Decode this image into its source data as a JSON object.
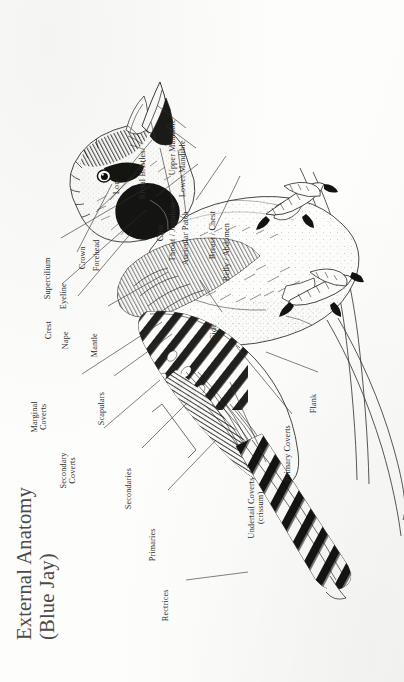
{
  "title": {
    "line1": "External Anatomy",
    "line2": "(Blue Jay)"
  },
  "subject": "Blue Jay",
  "diagram_type": "labeled anatomical illustration",
  "orientation": "bird rotated 90 degrees; head upper-left, tail lower-right",
  "colors": {
    "paper": "#fdfdfc",
    "ink": "#1b1b18",
    "leader_line": "#33332f",
    "title_text": "#4a4a48",
    "label_text": "#2c2c2c"
  },
  "labels": [
    {
      "id": "supercilium",
      "text": "Supercilium"
    },
    {
      "id": "eyeline",
      "text": "Eyeline"
    },
    {
      "id": "crown",
      "text": "Crown"
    },
    {
      "id": "forehead",
      "text": "Forehead"
    },
    {
      "id": "lore",
      "text": "Lore"
    },
    {
      "id": "rictal-bristles",
      "text": "Rictal Bristles"
    },
    {
      "id": "upper-mandible",
      "text": "Upper Mandible"
    },
    {
      "id": "lower-mandible",
      "text": "Lower Mandible"
    },
    {
      "id": "chin",
      "text": "Chin"
    },
    {
      "id": "throat-jugulum",
      "text": "Throat / Jugulum"
    },
    {
      "id": "auricular-patch",
      "text": "Auricular Patch"
    },
    {
      "id": "breast-chest",
      "text": "Breast / Chest"
    },
    {
      "id": "belly-abdomen",
      "text": "Belly / Abdomen"
    },
    {
      "id": "crest",
      "text": "Crest"
    },
    {
      "id": "nape",
      "text": "Nape"
    },
    {
      "id": "mantle",
      "text": "Mantle"
    },
    {
      "id": "side",
      "text": "Side"
    },
    {
      "id": "marginal-coverts",
      "text": "Marginal",
      "text2": "Coverts"
    },
    {
      "id": "scapulars",
      "text": "Scapulars"
    },
    {
      "id": "secondary-coverts",
      "text": "Secondary",
      "text2": "Coverts"
    },
    {
      "id": "secondaries",
      "text": "Secondaries"
    },
    {
      "id": "primaries",
      "text": "Primaries"
    },
    {
      "id": "rectrices",
      "text": "Rectrices"
    },
    {
      "id": "undertail-coverts",
      "text": "Undertail Coverts",
      "text2": "(crissum)"
    },
    {
      "id": "primary-coverts",
      "text": "Primary Coverts"
    },
    {
      "id": "flank",
      "text": "Flank"
    }
  ]
}
